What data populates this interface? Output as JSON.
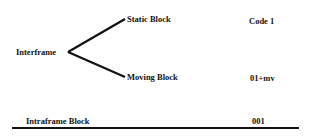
{
  "diagram": {
    "root": {
      "label": "Interframe"
    },
    "branches": [
      {
        "label": "Static Block",
        "code": "Code 1"
      },
      {
        "label": "Moving Block",
        "code": "01+mv"
      }
    ],
    "intraframe": {
      "label": "Intraframe Block",
      "code": "001"
    }
  }
}
